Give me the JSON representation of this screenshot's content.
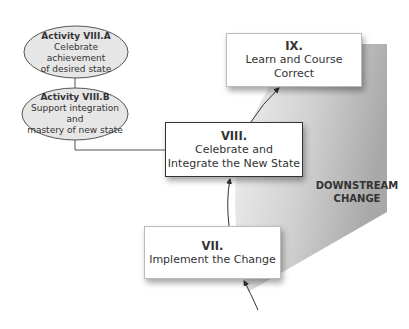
{
  "diagram": {
    "region_label": {
      "line1": "DOWNSTREAM",
      "line2": "CHANGE"
    },
    "stages": [
      {
        "number": "VII.",
        "title_line1": "Implement the Change",
        "title_line2": ""
      },
      {
        "number": "VIII.",
        "title_line1": "Celebrate and",
        "title_line2": "Integrate the New State"
      },
      {
        "number": "IX.",
        "title_line1": "Learn and Course",
        "title_line2": "Correct"
      }
    ],
    "activities": [
      {
        "label": "Activity VIII.A",
        "line1": "Celebrate achievement",
        "line2": "of desired state"
      },
      {
        "label": "Activity VIII.B",
        "line1": "Support integration and",
        "line2": "mastery of new state"
      }
    ],
    "colors": {
      "ellipse_fill": "#e6e6e6",
      "region_gray": "#b5b5b5",
      "line": "#333333"
    }
  }
}
